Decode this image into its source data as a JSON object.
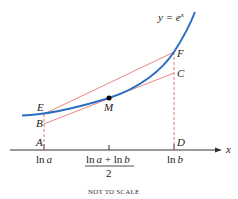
{
  "diagram": {
    "curve_label": {
      "prefix": "y = e",
      "superscript": "x"
    },
    "points": {
      "E": "E",
      "B": "B",
      "M": "M",
      "F": "F",
      "C": "C",
      "A": "A",
      "D": "D"
    },
    "axis": {
      "label": "x",
      "ticks": {
        "ln_a": {
          "ln": "ln",
          "var": "a"
        },
        "mid_numerator": {
          "ln1": "ln",
          "var1": "a",
          "plus": " + ",
          "ln2": "ln",
          "var2": "b"
        },
        "mid_denominator": "2",
        "ln_b": {
          "ln": "ln",
          "var": "b"
        }
      }
    },
    "note": "NOT TO SCALE",
    "colors": {
      "curve": "#2e6fc4",
      "secant": "#e9877f",
      "dashed": "#e07a72",
      "axis": "#333333",
      "point": "#000000"
    }
  }
}
